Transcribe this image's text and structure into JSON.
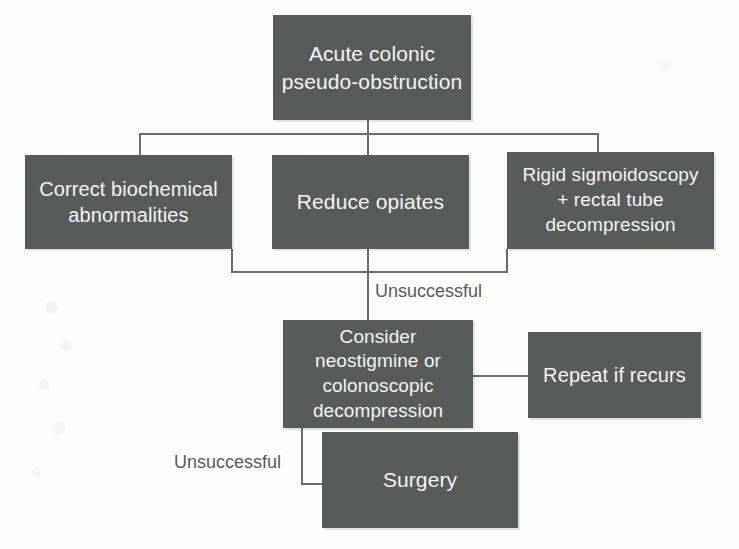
{
  "diagram": {
    "type": "flowchart",
    "colors": {
      "node_fill": "#575c5a",
      "node_text": "#f4f4f2",
      "edge": "#6c6c6c",
      "background": "#fdfdfc",
      "edge_label_text": "#5a5a5a"
    },
    "nodes": [
      {
        "id": "root",
        "label": "Acute colonic\npseudo-obstruction"
      },
      {
        "id": "biochem",
        "label": "Correct biochemical\nabnormalities"
      },
      {
        "id": "opiates",
        "label": "Reduce opiates"
      },
      {
        "id": "sigmoid",
        "label": "Rigid sigmoidoscopy\n+ rectal tube\ndecompression"
      },
      {
        "id": "consider",
        "label": "Consider\nneostigmine or\ncolonoscopic\ndecompression"
      },
      {
        "id": "repeat",
        "label": "Repeat if recurs"
      },
      {
        "id": "surgery",
        "label": "Surgery"
      }
    ],
    "edge_labels": [
      {
        "id": "unsuccessful-1",
        "text": "Unsuccessful"
      },
      {
        "id": "unsuccessful-2",
        "text": "Unsuccessful"
      }
    ],
    "edges": [
      {
        "from": "root",
        "to": "biochem"
      },
      {
        "from": "root",
        "to": "opiates"
      },
      {
        "from": "root",
        "to": "sigmoid"
      },
      {
        "from": "biochem",
        "to": "consider",
        "label": "Unsuccessful"
      },
      {
        "from": "opiates",
        "to": "consider",
        "label": "Unsuccessful"
      },
      {
        "from": "sigmoid",
        "to": "consider",
        "label": "Unsuccessful"
      },
      {
        "from": "consider",
        "to": "repeat"
      },
      {
        "from": "consider",
        "to": "surgery",
        "label": "Unsuccessful"
      }
    ]
  }
}
